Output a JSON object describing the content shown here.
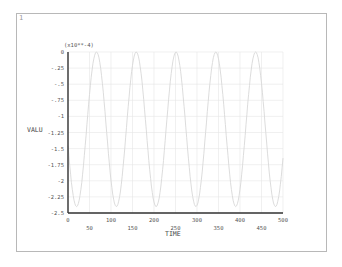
{
  "window": {
    "number": "1"
  },
  "chart_data": {
    "type": "line",
    "title": "",
    "xlabel": "TIME",
    "ylabel": "VALU",
    "y_multiplier": "(x10**-4)",
    "xlim": [
      0,
      500
    ],
    "ylim": [
      -2.5,
      0
    ],
    "x_ticks_upper": [
      "0",
      "100",
      "200",
      "300",
      "400",
      "500"
    ],
    "x_ticks_lower": [
      "50",
      "150",
      "250",
      "350",
      "450"
    ],
    "y_ticks": [
      "0",
      "-.25",
      "-.5",
      "-.75",
      "-1",
      "-1.25",
      "-1.5",
      "-1.75",
      "-2",
      "-2.25",
      "-2.5"
    ],
    "grid": true,
    "legend": "none",
    "series": [
      {
        "name": "VALU",
        "color": "#d8d8d8",
        "description": "periodic oscillation between ~0 and ~-2.4 (x10**-4), about 4.5 cycles over TIME 0-500",
        "x": [
          0,
          20,
          40,
          65,
          90,
          110,
          135,
          160,
          180,
          205,
          225,
          250,
          275,
          295,
          320,
          340,
          365,
          390,
          410,
          435,
          460,
          480,
          500
        ],
        "values": [
          -1.4,
          -2.4,
          -1.2,
          0,
          -1.2,
          -2.4,
          -1.2,
          0,
          -1.2,
          -2.4,
          -1.2,
          0,
          -1.2,
          -2.4,
          -1.2,
          0,
          -1.2,
          -2.4,
          -1.2,
          0,
          -1.2,
          -2.4,
          -1.5
        ]
      }
    ]
  },
  "colors": {
    "axis": "#333333",
    "grid": "#e6e6e6",
    "curve": "#d8d8d8",
    "frame": "#b8b8b8"
  }
}
